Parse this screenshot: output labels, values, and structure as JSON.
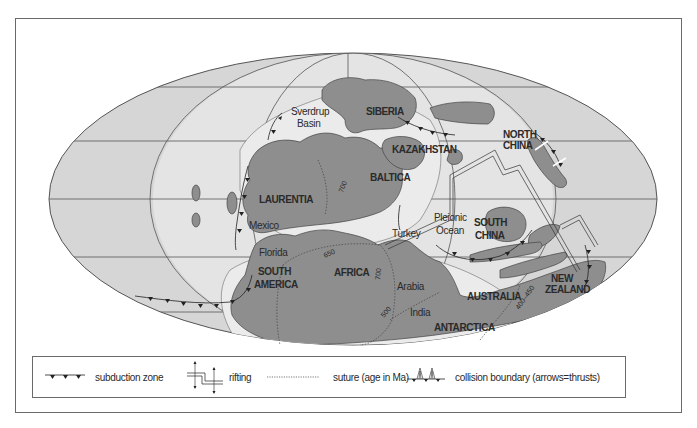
{
  "map": {
    "colors": {
      "ocean": "#d6d6d6",
      "land": "#8e8e8e",
      "shelf": "#ebebeb",
      "lines": "#3a3a3a",
      "frame": "#6a6a6a"
    },
    "labels": {
      "siberia": "SIBERIA",
      "sverdrup_1": "Sverdrup",
      "sverdrup_2": "Basin",
      "north_china_1": "NORTH",
      "north_china_2": "CHINA",
      "kazakhstan": "KAZAKHSTAN",
      "baltica": "BALTICA",
      "laurentia": "LAURENTIA",
      "mexico": "Mexico",
      "florida": "Florida",
      "south_america_1": "SOUTH",
      "south_america_2": "AMERICA",
      "africa": "AFRICA",
      "turkey": "Turkey",
      "pleionic_1": "Pleionic",
      "pleionic_2": "Ocean",
      "south_china_1": "SOUTH",
      "south_china_2": "CHINA",
      "arabia": "Arabia",
      "india": "India",
      "australia": "AUSTRALIA",
      "new_zealand_1": "NEW",
      "new_zealand_2": "ZEALAND",
      "antarctica": "ANTARCTICA"
    },
    "suture_ages": {
      "a": "700",
      "b": "650",
      "c": "700",
      "d": "500",
      "e": "400–450"
    }
  },
  "legend": {
    "items": [
      {
        "symbol": "subduction-zone",
        "label": "subduction zone"
      },
      {
        "symbol": "rifting",
        "label": "rifting"
      },
      {
        "symbol": "suture",
        "label": "suture (age in Ma)"
      },
      {
        "symbol": "collision-boundary",
        "label": "collision boundary (arrows=thrusts)"
      }
    ]
  }
}
